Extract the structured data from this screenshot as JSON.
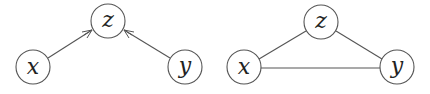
{
  "diagrams": [
    {
      "name": "directed-graph",
      "nodes": [
        {
          "id": "x",
          "label": "x",
          "cx": 33,
          "cy": 67,
          "r": 17
        },
        {
          "id": "z",
          "label": "z",
          "cx": 108,
          "cy": 21,
          "r": 17
        },
        {
          "id": "y",
          "label": "y",
          "cx": 185,
          "cy": 67,
          "r": 17
        }
      ],
      "edges": [
        {
          "from": "x",
          "to": "z",
          "directed": true
        },
        {
          "from": "y",
          "to": "z",
          "directed": true
        }
      ]
    },
    {
      "name": "undirected-graph",
      "nodes": [
        {
          "id": "x",
          "label": "x",
          "cx": 244,
          "cy": 67,
          "r": 17
        },
        {
          "id": "z",
          "label": "z",
          "cx": 321,
          "cy": 22,
          "r": 17
        },
        {
          "id": "y",
          "label": "y",
          "cx": 397,
          "cy": 67,
          "r": 17
        }
      ],
      "edges": [
        {
          "from": "x",
          "to": "z",
          "directed": false
        },
        {
          "from": "z",
          "to": "y",
          "directed": false
        },
        {
          "from": "x",
          "to": "y",
          "directed": false
        }
      ]
    }
  ]
}
